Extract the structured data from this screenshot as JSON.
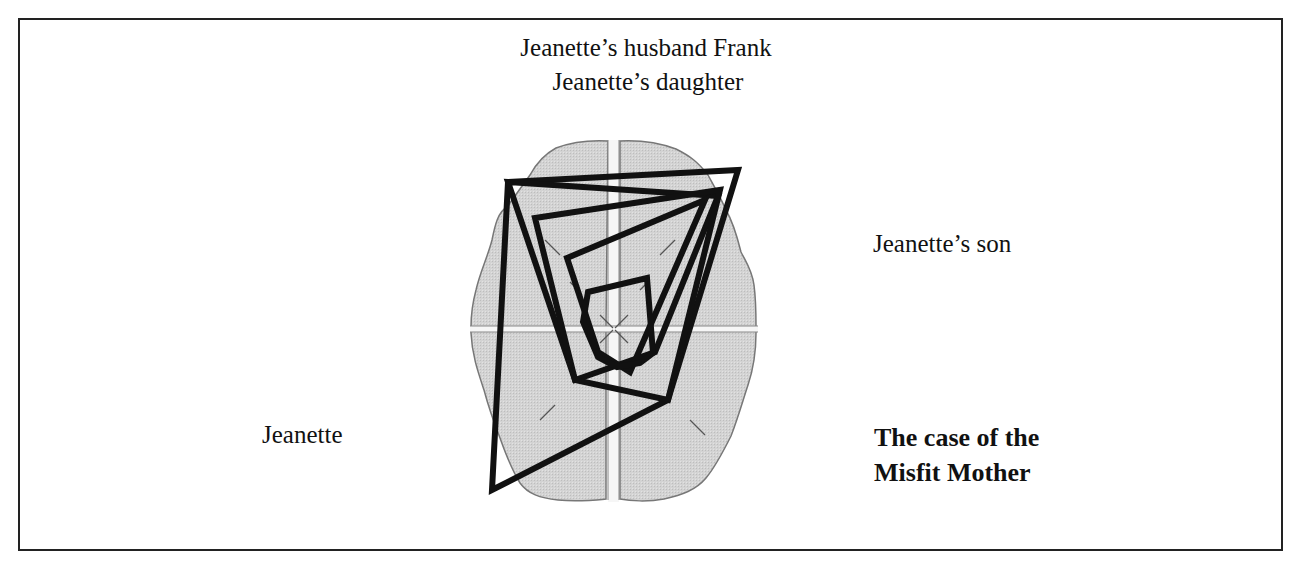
{
  "labels": {
    "top_line1": "Jeanette’s husband Frank",
    "top_line2": "Jeanette’s daughter",
    "right": "Jeanette’s son",
    "left": "Jeanette",
    "title_line1": "The case of the",
    "title_line2": "Misfit Mother"
  },
  "colors": {
    "brain_fill": "#d0d0d0",
    "brain_outline": "#777777",
    "midline": "#f4f4f4",
    "polygon_stroke": "#111111",
    "frame": "#222222"
  },
  "chart_data": {
    "type": "radar-overlay",
    "background": "brain (top view) divided into four quadrants",
    "axes": [
      {
        "direction": "top-left",
        "label": "Jeanette’s husband Frank / Jeanette’s daughter"
      },
      {
        "direction": "top-right",
        "label": "Jeanette’s son"
      },
      {
        "direction": "bottom-right",
        "label": "The case of the Misfit Mother"
      },
      {
        "direction": "bottom-left",
        "label": "Jeanette"
      }
    ],
    "center": [
      614,
      324
    ],
    "polygons": [
      {
        "name": "polygon-1",
        "points": [
          [
            508,
            182
          ],
          [
            738,
            170
          ],
          [
            668,
            400
          ],
          [
            492,
            490
          ]
        ]
      },
      {
        "name": "polygon-2",
        "points": [
          [
            508,
            182
          ],
          [
            718,
            196
          ],
          [
            655,
            352
          ],
          [
            575,
            380
          ]
        ]
      },
      {
        "name": "polygon-3",
        "points": [
          [
            535,
            218
          ],
          [
            720,
            190
          ],
          [
            668,
            400
          ],
          [
            575,
            380
          ]
        ]
      },
      {
        "name": "polygon-4",
        "points": [
          [
            567,
            258
          ],
          [
            705,
            200
          ],
          [
            630,
            372
          ],
          [
            598,
            352
          ]
        ]
      },
      {
        "name": "polygon-5",
        "points": [
          [
            588,
            292
          ],
          [
            647,
            278
          ],
          [
            653,
            353
          ],
          [
            640,
            363
          ],
          [
            617,
            367
          ],
          [
            598,
            357
          ],
          [
            583,
            322
          ]
        ]
      }
    ]
  }
}
